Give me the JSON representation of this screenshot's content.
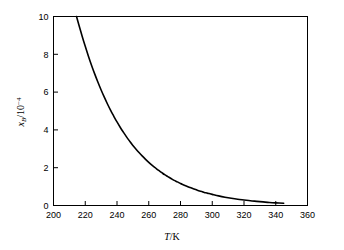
{
  "chart_data": {
    "type": "line",
    "title": "",
    "subtitle": "",
    "xlabel": "T/K",
    "ylabel": "x_B/10^-4",
    "xlabel_parts": {
      "variable": "T",
      "separator": "/",
      "unit": "K"
    },
    "ylabel_parts": {
      "variable": "x",
      "subscript": "B",
      "separator": "/10",
      "superscript": "−4"
    },
    "xlim": [
      200,
      360
    ],
    "ylim": [
      0,
      10
    ],
    "xticks": [
      200,
      220,
      240,
      260,
      280,
      300,
      320,
      340,
      360
    ],
    "yticks": [
      0,
      2,
      4,
      6,
      8,
      10
    ],
    "xtick_labels": [
      "200",
      "220",
      "240",
      "260",
      "280",
      "300",
      "320",
      "340",
      "360"
    ],
    "ytick_labels": [
      "0",
      "2",
      "4",
      "6",
      "8",
      "10"
    ],
    "grid": false,
    "legend": null,
    "legend_position": "none",
    "annotations": [],
    "series": [
      {
        "name": "solubility",
        "color": "#000000",
        "x": [
          214.5,
          216,
          218,
          220,
          222,
          224,
          226,
          228,
          230,
          232,
          234,
          236,
          238,
          240,
          242,
          244,
          246,
          248,
          250,
          252,
          254,
          256,
          258,
          260,
          262,
          264,
          266,
          268,
          270,
          272,
          274,
          276,
          278,
          280,
          282,
          284,
          286,
          288,
          290,
          292,
          294,
          296,
          298,
          300,
          304,
          308,
          312,
          316,
          320,
          324,
          328,
          332,
          336,
          340,
          345
        ],
        "y": [
          10.0,
          9.55,
          8.97,
          8.42,
          7.9,
          7.41,
          6.95,
          6.52,
          6.11,
          5.73,
          5.37,
          5.03,
          4.72,
          4.42,
          4.14,
          3.88,
          3.63,
          3.4,
          3.18,
          2.98,
          2.79,
          2.61,
          2.44,
          2.28,
          2.13,
          2.0,
          1.87,
          1.75,
          1.63,
          1.53,
          1.43,
          1.33,
          1.25,
          1.16,
          1.09,
          1.02,
          0.95,
          0.89,
          0.83,
          0.77,
          0.72,
          0.67,
          0.63,
          0.59,
          0.51,
          0.44,
          0.38,
          0.33,
          0.29,
          0.25,
          0.22,
          0.19,
          0.16,
          0.14,
          0.12
        ]
      }
    ]
  },
  "figure": {
    "background_color": "#ffffff",
    "axis_color": "#000000",
    "curve_color": "#000000"
  }
}
